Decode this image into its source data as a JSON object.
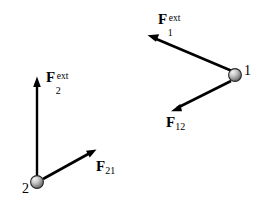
{
  "figure": {
    "type": "physics-free-body-diagram",
    "width": 260,
    "height": 217,
    "background_color": "#ffffff",
    "stroke_color": "#000000",
    "text_color": "#000000"
  },
  "particles": [
    {
      "id": "particle-1",
      "label": "1",
      "cx": 235,
      "cy": 75,
      "r": 6.5,
      "label_x": 244,
      "label_y": 64,
      "fill_light": "#e8e8e8",
      "fill_dark": "#6e6e6e",
      "outline": "#1a1a1a"
    },
    {
      "id": "particle-2",
      "label": "2",
      "cx": 37,
      "cy": 182,
      "r": 6.5,
      "label_x": 22,
      "label_y": 182,
      "fill_light": "#e8e8e8",
      "fill_dark": "#6e6e6e",
      "outline": "#1a1a1a"
    }
  ],
  "vectors": [
    {
      "id": "force-1-ext",
      "name": "F1ext",
      "base": "F",
      "sub": "1",
      "sup": "ext",
      "from_x": 232,
      "from_y": 71,
      "to_x": 149,
      "to_y": 36,
      "label_x": 158,
      "label_y": 12,
      "description": "external force on particle 1"
    },
    {
      "id": "force-12",
      "name": "F12",
      "base": "F",
      "sub": "12",
      "sup": "",
      "from_x": 231,
      "from_y": 81,
      "to_x": 172,
      "to_y": 111,
      "label_x": 166,
      "label_y": 115,
      "description": "force on particle 1 due to particle 2"
    },
    {
      "id": "force-2-ext",
      "name": "F2ext",
      "base": "F",
      "sub": "2",
      "sup": "ext",
      "from_x": 37,
      "from_y": 176,
      "to_x": 37,
      "to_y": 77,
      "label_x": 46,
      "label_y": 70,
      "description": "external force on particle 2"
    },
    {
      "id": "force-21",
      "name": "F21",
      "base": "F",
      "sub": "21",
      "sup": "",
      "from_x": 43,
      "from_y": 179,
      "to_x": 96,
      "to_y": 150,
      "label_x": 96,
      "label_y": 159,
      "description": "force on particle 2 due to particle 1"
    }
  ]
}
